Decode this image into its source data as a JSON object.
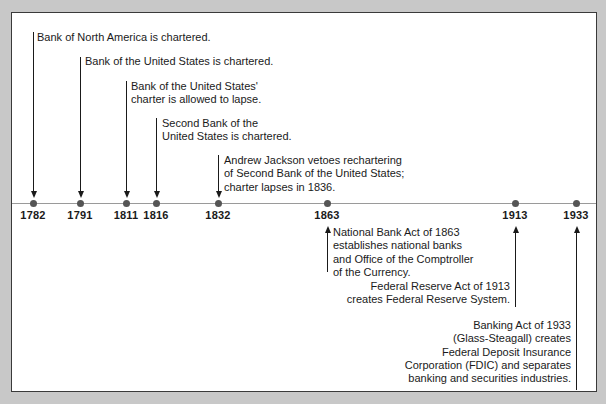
{
  "timeline": {
    "events": [
      {
        "year": "1782",
        "x": 21,
        "text": [
          "Bank of North America is chartered."
        ],
        "side": "above"
      },
      {
        "year": "1791",
        "x": 68,
        "text": [
          "Bank of the United States is chartered."
        ],
        "side": "above"
      },
      {
        "year": "1811",
        "x": 114,
        "text": [
          "Bank of the United States'",
          "charter is allowed to lapse."
        ],
        "side": "above"
      },
      {
        "year": "1816",
        "x": 144,
        "text": [
          "Second Bank of the",
          "United States is chartered."
        ],
        "side": "above"
      },
      {
        "year": "1832",
        "x": 206,
        "text": [
          "Andrew Jackson vetoes rechartering",
          "of Second Bank of the United States;",
          "charter lapses in 1836."
        ],
        "side": "above"
      },
      {
        "year": "1863",
        "x": 315,
        "text": [
          "National Bank Act of 1863",
          "establishes national banks",
          "and Office of the Comptroller",
          "of the Currency."
        ],
        "side": "below"
      },
      {
        "year": "1913",
        "x": 503,
        "text": [
          "Federal Reserve Act of 1913",
          "creates Federal Reserve System."
        ],
        "side": "below"
      },
      {
        "year": "1933",
        "x": 564,
        "text": [
          "Banking Act of 1933",
          "(Glass-Steagall) creates",
          "Federal Deposit Insurance",
          "Corporation (FDIC) and separates",
          "banking and securities industries."
        ],
        "side": "below"
      }
    ]
  },
  "labels": {
    "e0": "Bank of North America is chartered.",
    "e1": "Bank of the United States is chartered.",
    "e2_l1": "Bank of the United States'",
    "e2_l2": "charter is allowed to lapse.",
    "e3_l1": "Second Bank of the",
    "e3_l2": "United States is chartered.",
    "e4_l1": "Andrew Jackson vetoes rechartering",
    "e4_l2": "of Second Bank of the United States;",
    "e4_l3": "charter lapses in 1836.",
    "e5_l1": "National Bank Act of 1863",
    "e5_l2": "establishes national banks",
    "e5_l3": "and Office of the Comptroller",
    "e5_l4": "of the Currency.",
    "e6_l1": "Federal Reserve Act of 1913",
    "e6_l2": "creates Federal Reserve System.",
    "e7_l1": "Banking Act of 1933",
    "e7_l2": "(Glass-Steagall) creates",
    "e7_l3": "Federal Deposit Insurance",
    "e7_l4": "Corporation (FDIC) and separates",
    "e7_l5": "banking and securities industries."
  },
  "years": [
    "1782",
    "1791",
    "1811",
    "1816",
    "1832",
    "1863",
    "1913",
    "1933"
  ]
}
